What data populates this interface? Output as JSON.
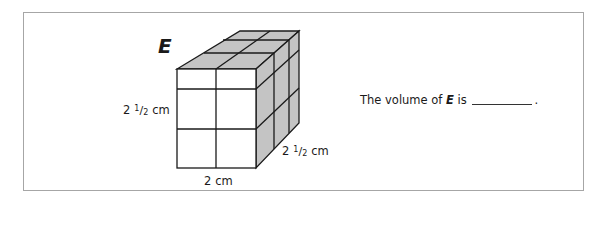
{
  "figure": {
    "letter": "E",
    "height_label": {
      "whole": "2",
      "num": "1",
      "den": "2",
      "unit": "cm"
    },
    "depth_label": {
      "whole": "2",
      "num": "1",
      "den": "2",
      "unit": "cm"
    },
    "width_label": "2 cm",
    "colors": {
      "top_side_fill": "#c4c4c4",
      "front_fill": "#ffffff",
      "edge": "#1a1a1a",
      "frame": "#a6a6a6"
    }
  },
  "question": {
    "prefix": "The volume of ",
    "letter": "E",
    "middle": " is",
    "suffix": "."
  }
}
